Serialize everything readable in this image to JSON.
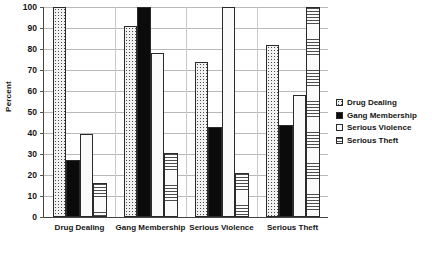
{
  "chart_data": {
    "type": "bar",
    "title": "",
    "xlabel": "",
    "ylabel": "Percent",
    "ylim": [
      0,
      100
    ],
    "ytick_step": 10,
    "yticks": [
      0,
      10,
      20,
      30,
      40,
      50,
      60,
      70,
      80,
      90,
      100
    ],
    "grid": true,
    "legend_position": "right",
    "categories": [
      "Drug Dealing",
      "Gang Membership",
      "Serious Violence",
      "Serious Theft"
    ],
    "series": [
      {
        "name": "Drug Dealing",
        "fill": "fill-dots-sparse",
        "values": [
          100,
          91,
          74,
          82
        ]
      },
      {
        "name": "Gang Membership",
        "fill": "fill-solid-black",
        "values": [
          27,
          100,
          43,
          44
        ]
      },
      {
        "name": "Serious Violence",
        "fill": "fill-plain-light",
        "values": [
          39.5,
          78,
          100,
          58
        ]
      },
      {
        "name": "Serious Theft",
        "fill": "fill-hlines",
        "values": [
          16,
          30.5,
          21,
          100
        ]
      }
    ]
  },
  "legend": {
    "items": [
      {
        "label": "Drug Dealing",
        "fill": "fill-dots-sparse"
      },
      {
        "label": "Gang Membership",
        "fill": "fill-solid-black"
      },
      {
        "label": "Serious Violence",
        "fill": "fill-plain-light"
      },
      {
        "label": "Serious Theft",
        "fill": "fill-hlines"
      }
    ]
  },
  "colors": {
    "axis": "#444444",
    "grid": "#b9b9b9",
    "text": "#141414",
    "bar_outline": "#2a2a2a"
  }
}
